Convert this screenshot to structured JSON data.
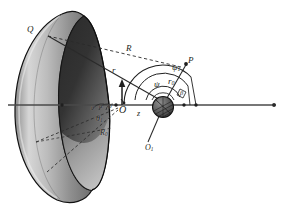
{
  "figure": {
    "background_color": "#ffffff",
    "ink_color": "#231f20",
    "axis_color": "#555555",
    "dish": {
      "outer_fill_light": "#b9b9b9",
      "outer_fill_dark": "#3a3a3a",
      "inner_fill": "#4a4a4a",
      "rim_stroke": "#151515"
    },
    "sphere": {
      "fill": "#5a5a5a",
      "stroke": "#1a1a1a",
      "hatch_color": "#2a2a2a"
    }
  },
  "labels": {
    "Q": {
      "text": "Q",
      "sub": "",
      "x": 27,
      "y": 25,
      "size": "lbl-md"
    },
    "R": {
      "text": "R",
      "sub": "",
      "x": 126,
      "y": 44,
      "size": "lbl-md"
    },
    "r": {
      "text": "r",
      "sub": "",
      "x": 112,
      "y": 66,
      "size": "lbl-md"
    },
    "P": {
      "text": "P",
      "sub": "",
      "x": 188,
      "y": 58,
      "size": "lbl-md"
    },
    "psi1": {
      "text": "ψ",
      "sub": "1",
      "x": 172,
      "y": 66,
      "size": "lbl-md"
    },
    "psi": {
      "text": "ψ",
      "sub": "",
      "x": 155,
      "y": 83,
      "size": "lbl-md"
    },
    "r0": {
      "text": "r",
      "sub": "0",
      "x": 169,
      "y": 81,
      "size": "lbl-md"
    },
    "beta": {
      "text": "β",
      "sub": "",
      "x": 186,
      "y": 94,
      "size": "lbl-xs"
    },
    "O": {
      "text": "O",
      "sub": "",
      "x": 119,
      "y": 110,
      "size": "lbl-md"
    },
    "z": {
      "text": "z",
      "sub": "",
      "x": 137,
      "y": 113,
      "size": "lbl-sm"
    },
    "theta": {
      "text": "θ",
      "sub": "",
      "x": 93,
      "y": 108,
      "size": "lbl-xs"
    },
    "alpha": {
      "text": "α",
      "sub": "",
      "x": 101,
      "y": 106,
      "size": "lbl-xs"
    },
    "phi": {
      "text": "φ",
      "sub": "",
      "x": 109,
      "y": 107,
      "size": "lbl-xs"
    },
    "theta1": {
      "text": "θ",
      "sub": "1",
      "x": 97,
      "y": 119,
      "size": "lbl-sm"
    },
    "R0": {
      "text": "R",
      "sub": "0",
      "x": 100,
      "y": 133,
      "size": "lbl-sm"
    },
    "O1": {
      "text": "O",
      "sub": "1",
      "x": 148,
      "y": 148,
      "size": "lbl-sm"
    }
  },
  "geometry": {
    "axis": {
      "x1": 8,
      "y1": 105,
      "x2": 278,
      "y2": 105
    },
    "points": {
      "Q": {
        "x": 48,
        "y": 36
      },
      "O": {
        "x": 116,
        "y": 105
      },
      "center": {
        "x": 163,
        "y": 105
      },
      "P": {
        "x": 186,
        "y": 65
      },
      "axis_end": {
        "x": 274,
        "y": 105
      },
      "rim_lower": {
        "x": 35,
        "y": 141
      },
      "rim_lower2": {
        "x": 46,
        "y": 172
      }
    }
  }
}
